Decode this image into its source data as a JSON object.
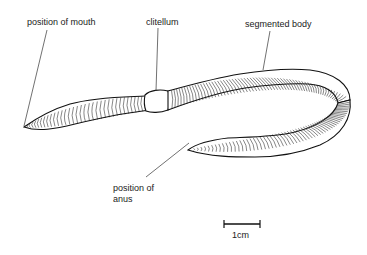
{
  "diagram": {
    "labels": {
      "mouth": "position of mouth",
      "clitellum": "clitellum",
      "segmented_body": "segmented body",
      "anus_line1": "position of",
      "anus_line2": "anus"
    },
    "scale_bar": {
      "label": "1cm"
    }
  }
}
